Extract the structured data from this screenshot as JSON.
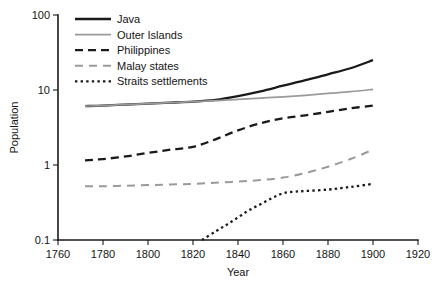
{
  "chart_data": {
    "type": "line",
    "title": "",
    "subtitle": "",
    "xlabel": "Year",
    "ylabel": "Population",
    "xlim": [
      1760,
      1920
    ],
    "ylim": [
      0.1,
      100
    ],
    "yscale": "log",
    "xticks": [
      1760,
      1780,
      1800,
      1820,
      1840,
      1860,
      1880,
      1900,
      1920
    ],
    "xticklabels": [
      "1760",
      "1780",
      "1800",
      "1820",
      "1840",
      "1860",
      "1880",
      "1900",
      "1920"
    ],
    "yticks": [
      0.1,
      1,
      10,
      100
    ],
    "yticklabels": [
      "0.1",
      "1",
      "10",
      "100"
    ],
    "grid": false,
    "legend_position": "top-left-inside",
    "units_note": "Population in millions (log scale)",
    "series": [
      {
        "name": "Java",
        "color": "#1a1a1a",
        "width": 2.3,
        "dash": "none",
        "points": [
          [
            1772,
            6.1
          ],
          [
            1780,
            6.2
          ],
          [
            1790,
            6.4
          ],
          [
            1800,
            6.6
          ],
          [
            1810,
            6.8
          ],
          [
            1820,
            7.0
          ],
          [
            1830,
            7.4
          ],
          [
            1840,
            8.3
          ],
          [
            1850,
            9.6
          ],
          [
            1860,
            11.4
          ],
          [
            1870,
            13.5
          ],
          [
            1880,
            16.2
          ],
          [
            1890,
            19.5
          ],
          [
            1900,
            25.0
          ]
        ]
      },
      {
        "name": "Outer Islands",
        "color": "#9a9a9a",
        "width": 1.7,
        "dash": "none",
        "points": [
          [
            1772,
            6.1
          ],
          [
            1780,
            6.2
          ],
          [
            1790,
            6.4
          ],
          [
            1800,
            6.6
          ],
          [
            1810,
            6.8
          ],
          [
            1820,
            7.0
          ],
          [
            1830,
            7.2
          ],
          [
            1840,
            7.5
          ],
          [
            1850,
            7.8
          ],
          [
            1860,
            8.1
          ],
          [
            1870,
            8.5
          ],
          [
            1880,
            9.0
          ],
          [
            1890,
            9.5
          ],
          [
            1900,
            10.2
          ]
        ]
      },
      {
        "name": "Philippines",
        "color": "#1a1a1a",
        "width": 2.3,
        "dash": "8,5",
        "points": [
          [
            1772,
            1.15
          ],
          [
            1780,
            1.2
          ],
          [
            1790,
            1.3
          ],
          [
            1800,
            1.45
          ],
          [
            1810,
            1.6
          ],
          [
            1820,
            1.75
          ],
          [
            1830,
            2.2
          ],
          [
            1840,
            2.9
          ],
          [
            1850,
            3.6
          ],
          [
            1860,
            4.2
          ],
          [
            1870,
            4.6
          ],
          [
            1880,
            5.1
          ],
          [
            1890,
            5.7
          ],
          [
            1900,
            6.2
          ]
        ]
      },
      {
        "name": "Malay states",
        "color": "#9a9a9a",
        "width": 2.0,
        "dash": "8,6",
        "points": [
          [
            1772,
            0.52
          ],
          [
            1780,
            0.52
          ],
          [
            1790,
            0.53
          ],
          [
            1800,
            0.54
          ],
          [
            1810,
            0.55
          ],
          [
            1820,
            0.56
          ],
          [
            1830,
            0.58
          ],
          [
            1840,
            0.6
          ],
          [
            1850,
            0.63
          ],
          [
            1860,
            0.68
          ],
          [
            1870,
            0.78
          ],
          [
            1880,
            0.95
          ],
          [
            1890,
            1.2
          ],
          [
            1900,
            1.6
          ]
        ]
      },
      {
        "name": "Straits settlements",
        "color": "#1a1a1a",
        "width": 2.3,
        "dash": "2.4,3.2",
        "points": [
          [
            1824,
            0.1
          ],
          [
            1830,
            0.13
          ],
          [
            1835,
            0.16
          ],
          [
            1840,
            0.2
          ],
          [
            1845,
            0.25
          ],
          [
            1850,
            0.3
          ],
          [
            1855,
            0.36
          ],
          [
            1860,
            0.42
          ],
          [
            1865,
            0.44
          ],
          [
            1870,
            0.45
          ],
          [
            1880,
            0.47
          ],
          [
            1890,
            0.51
          ],
          [
            1900,
            0.56
          ]
        ]
      }
    ]
  },
  "legend": {
    "items": [
      {
        "label": "Java"
      },
      {
        "label": "Outer Islands"
      },
      {
        "label": "Philippines"
      },
      {
        "label": "Malay states"
      },
      {
        "label": "Straits settlements"
      }
    ]
  }
}
